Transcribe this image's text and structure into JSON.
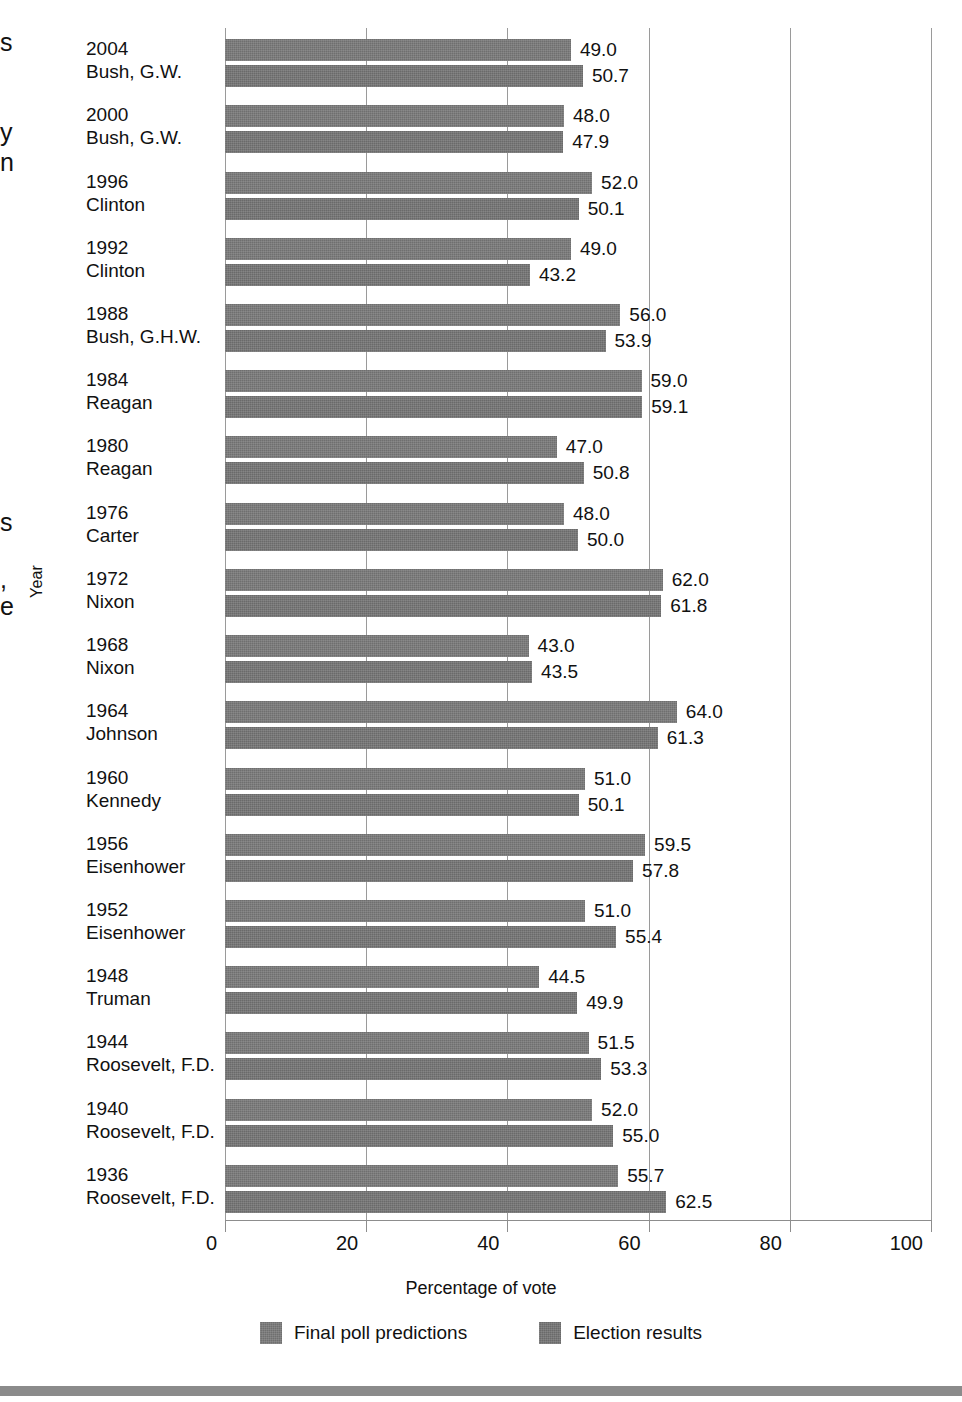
{
  "chart_data": {
    "type": "bar",
    "orientation": "horizontal",
    "title": "",
    "xlabel": "Percentage of vote",
    "ylabel": "Year",
    "xlim": [
      0,
      100
    ],
    "xticks": [
      "0",
      "20",
      "40",
      "60",
      "80",
      "100"
    ],
    "grid": true,
    "legend_position": "bottom",
    "categories": [
      {
        "year": "2004",
        "name": "Bush, G.W."
      },
      {
        "year": "2000",
        "name": "Bush, G.W."
      },
      {
        "year": "1996",
        "name": "Clinton"
      },
      {
        "year": "1992",
        "name": "Clinton"
      },
      {
        "year": "1988",
        "name": "Bush, G.H.W."
      },
      {
        "year": "1984",
        "name": "Reagan"
      },
      {
        "year": "1980",
        "name": "Reagan"
      },
      {
        "year": "1976",
        "name": "Carter"
      },
      {
        "year": "1972",
        "name": "Nixon"
      },
      {
        "year": "1968",
        "name": "Nixon"
      },
      {
        "year": "1964",
        "name": "Johnson"
      },
      {
        "year": "1960",
        "name": "Kennedy"
      },
      {
        "year": "1956",
        "name": "Eisenhower"
      },
      {
        "year": "1952",
        "name": "Eisenhower"
      },
      {
        "year": "1948",
        "name": "Truman"
      },
      {
        "year": "1944",
        "name": "Roosevelt, F.D."
      },
      {
        "year": "1940",
        "name": "Roosevelt, F.D."
      },
      {
        "year": "1936",
        "name": "Roosevelt, F.D."
      }
    ],
    "series": [
      {
        "name": "Final poll predictions",
        "color": "#6f6f6f",
        "values": [
          49.0,
          48.0,
          52.0,
          49.0,
          56.0,
          59.0,
          47.0,
          48.0,
          62.0,
          43.0,
          64.0,
          51.0,
          59.5,
          51.0,
          44.5,
          51.5,
          52.0,
          55.7
        ],
        "labels": [
          "49.0",
          "48.0",
          "52.0",
          "49.0",
          "56.0",
          "59.0",
          "47.0",
          "48.0",
          "62.0",
          "43.0",
          "64.0",
          "51.0",
          "59.5",
          "51.0",
          "44.5",
          "51.5",
          "52.0",
          "55.7"
        ]
      },
      {
        "name": "Election results",
        "color": "#6a6a6a",
        "values": [
          50.7,
          47.9,
          50.1,
          43.2,
          53.9,
          59.1,
          50.8,
          50.0,
          61.8,
          43.5,
          61.3,
          50.1,
          57.8,
          55.4,
          49.9,
          53.3,
          55.0,
          62.5
        ],
        "labels": [
          "50.7",
          "47.9",
          "50.1",
          "43.2",
          "53.9",
          "59.1",
          "50.8",
          "50.0",
          "61.8",
          "43.5",
          "61.3",
          "50.1",
          "57.8",
          "55.4",
          "49.9",
          "53.3",
          "55.0",
          "62.5"
        ]
      }
    ]
  },
  "axes": {
    "x_title": "Percentage of vote",
    "y_title": "Year"
  },
  "legend": {
    "items": [
      {
        "label": "Final poll predictions"
      },
      {
        "label": "Election results"
      }
    ]
  },
  "page_bleed": {
    "fragments": [
      "s",
      "y",
      "n",
      "s",
      ",",
      "e"
    ]
  }
}
